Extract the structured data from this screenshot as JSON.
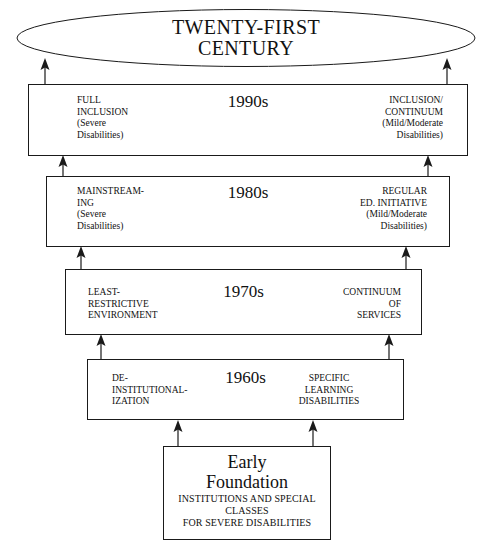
{
  "diagram": {
    "top_node": {
      "shape": "ellipse",
      "label": "TWENTY-FIRST\nCENTURY"
    },
    "eras": [
      {
        "decade": "1990s",
        "left_label": "FULL\nINCLUSION\n(Severe\nDisabilities)",
        "right_label": "INCLUSION/\nCONTINUUM\n(Mild/Moderate\nDisabilities)",
        "right_align": "right"
      },
      {
        "decade": "1980s",
        "left_label": "MAINSTREAM-\nING\n(Severe\nDisabilities)",
        "right_label": "REGULAR\nED. INITIATIVE\n(Mild/Moderate\nDisabilities)",
        "right_align": "right"
      },
      {
        "decade": "1970s",
        "left_label": "LEAST-\nRESTRICTIVE\nENVIRONMENT",
        "right_label": "CONTINUUM\nOF\nSERVICES",
        "right_align": "right"
      },
      {
        "decade": "1960s",
        "left_label": "DE-\nINSTITUTIONAL-\nIZATION",
        "right_label": "SPECIFIC\nLEARNING\nDISABILITIES",
        "right_align": "center"
      }
    ],
    "foundation": {
      "title": "Early\nFoundation",
      "subtitle": "INSTITUTIONS AND SPECIAL\nCLASSES\nFOR SEVERE DISABILITIES"
    },
    "arrows": {
      "direction": "upward",
      "count": 10,
      "icon": "arrow-up-icon"
    },
    "colors": {
      "background": "#ffffff",
      "stroke": "#1a1a1a",
      "text": "#111111"
    }
  }
}
